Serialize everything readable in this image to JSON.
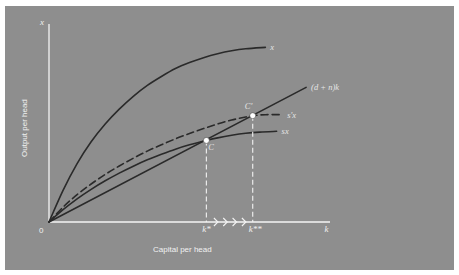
{
  "chart_data": {
    "type": "line",
    "title": "",
    "xlabel": "Capital per head",
    "ylabel": "Output per head",
    "x_axis_symbol": "k",
    "y_axis_symbol": "x",
    "origin_label": "0",
    "xlim": [
      0,
      10
    ],
    "ylim": [
      0,
      10
    ],
    "grid": false,
    "legend": "none",
    "series": [
      {
        "name": "x",
        "label": "x",
        "style": "solid",
        "points": [
          [
            0,
            0
          ],
          [
            0.5,
            1.6
          ],
          [
            1,
            2.95
          ],
          [
            1.5,
            4.05
          ],
          [
            2,
            4.95
          ],
          [
            2.5,
            5.7
          ],
          [
            3,
            6.35
          ],
          [
            3.5,
            6.9
          ],
          [
            4,
            7.35
          ],
          [
            4.5,
            7.75
          ],
          [
            5,
            8.05
          ],
          [
            5.5,
            8.3
          ],
          [
            6,
            8.5
          ],
          [
            6.5,
            8.65
          ],
          [
            7,
            8.75
          ],
          [
            7.7,
            8.82
          ]
        ]
      },
      {
        "name": "s'x",
        "label": "s'x",
        "style": "dashed",
        "points": [
          [
            0,
            0
          ],
          [
            0.5,
            0.75
          ],
          [
            1,
            1.38
          ],
          [
            1.5,
            1.92
          ],
          [
            2,
            2.4
          ],
          [
            2.5,
            2.83
          ],
          [
            3,
            3.22
          ],
          [
            3.5,
            3.58
          ],
          [
            4,
            3.9
          ],
          [
            4.5,
            4.2
          ],
          [
            5,
            4.47
          ],
          [
            5.5,
            4.72
          ],
          [
            6,
            4.95
          ],
          [
            6.5,
            5.15
          ],
          [
            7,
            5.3
          ],
          [
            7.25,
            5.37
          ],
          [
            7.7,
            5.42
          ],
          [
            8.3,
            5.42
          ]
        ]
      },
      {
        "name": "sx",
        "label": "sx",
        "style": "solid",
        "points": [
          [
            0,
            0
          ],
          [
            0.5,
            0.62
          ],
          [
            1,
            1.17
          ],
          [
            1.5,
            1.65
          ],
          [
            2,
            2.08
          ],
          [
            2.5,
            2.47
          ],
          [
            3,
            2.82
          ],
          [
            3.5,
            3.14
          ],
          [
            4,
            3.42
          ],
          [
            4.5,
            3.68
          ],
          [
            5,
            3.9
          ],
          [
            5.6,
            4.12
          ],
          [
            6,
            4.25
          ],
          [
            6.5,
            4.38
          ],
          [
            7,
            4.48
          ],
          [
            7.5,
            4.54
          ],
          [
            8.1,
            4.58
          ]
        ]
      },
      {
        "name": "(d+n)k",
        "label": "(d + n)k",
        "style": "solid",
        "points": [
          [
            0,
            0
          ],
          [
            9.15,
            6.8
          ]
        ]
      }
    ],
    "annotations": [
      {
        "label": "C",
        "x": 5.6,
        "y": 4.12,
        "type": "equilibrium-point"
      },
      {
        "label": "C'",
        "x": 7.25,
        "y": 5.37,
        "type": "equilibrium-point"
      }
    ],
    "x_ticks": [
      {
        "label": "k*",
        "x": 5.6
      },
      {
        "label": "k**",
        "x": 7.25
      },
      {
        "label": "k",
        "x": 9.95
      }
    ],
    "transition_arrows": {
      "from": 5.6,
      "to": 7.25,
      "count": 4,
      "direction": "right"
    }
  }
}
